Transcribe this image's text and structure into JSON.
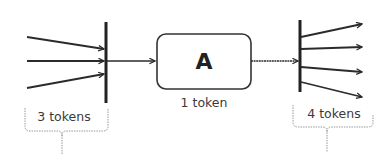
{
  "colors": {
    "stroke": "#2b2b2b",
    "bracket": "#9a9a9a",
    "text": "#3a3a3a",
    "background": "#ffffff"
  },
  "node": {
    "label": "A",
    "caption": "1 token"
  },
  "input_join": {
    "incoming_arrow_count": 3,
    "bracket_label": "3 tokens"
  },
  "output_fork": {
    "outgoing_arrow_count": 4,
    "bracket_label": "4 tokens"
  }
}
